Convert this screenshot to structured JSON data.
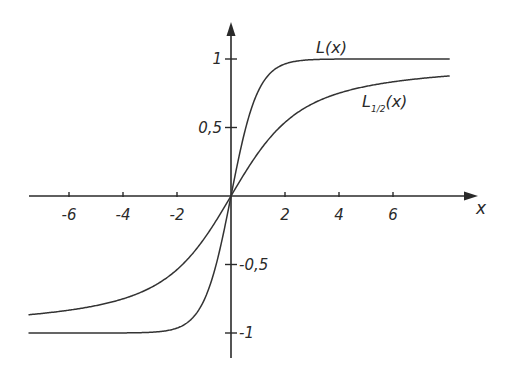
{
  "chart_data": {
    "type": "line",
    "title": "",
    "xlabel": "x",
    "ylabel": "",
    "xlim": [
      -7.5,
      8.1
    ],
    "ylim": [
      -1.2,
      1.3
    ],
    "grid": false,
    "legend_position": "inline labels",
    "x_ticks": [
      -6,
      -4,
      -2,
      2,
      4,
      6
    ],
    "x_tick_labels": [
      "-6",
      "-4",
      "-2",
      "2",
      "4",
      "6"
    ],
    "y_ticks": [
      1,
      0.5,
      -0.5,
      -1
    ],
    "y_tick_labels": [
      "1",
      "0,5",
      "-0,5",
      "-1"
    ],
    "series": [
      {
        "name": "L(x)",
        "label_main": "L",
        "label_sub": "",
        "label_arg": "(x)",
        "description": "steep sigmoid, saturates at ±1 near |x|≈2 (approx. tanh x)",
        "x": [
          -7.5,
          -6,
          -4,
          -3,
          -2,
          -1.5,
          -1,
          -0.5,
          0,
          0.5,
          1,
          1.5,
          2,
          3,
          4,
          6,
          8.1
        ],
        "y": [
          -1.0,
          -1.0,
          -1.0,
          -0.99,
          -0.96,
          -0.9,
          -0.76,
          -0.46,
          0.0,
          0.46,
          0.76,
          0.9,
          0.96,
          0.99,
          1.0,
          1.0,
          1.0
        ]
      },
      {
        "name": "L1/2(x)",
        "label_main": "L",
        "label_sub": "1/2",
        "label_arg": "(x)",
        "description": "slower sigmoid approaching ±1 (approx. Langevin function coth x − 1/x)",
        "x": [
          -7.5,
          -6,
          -4,
          -3,
          -2,
          -1,
          -0.5,
          0,
          0.5,
          1,
          2,
          3,
          4,
          6,
          8.1
        ],
        "y": [
          -0.87,
          -0.83,
          -0.75,
          -0.67,
          -0.54,
          -0.31,
          -0.16,
          0.0,
          0.16,
          0.31,
          0.54,
          0.67,
          0.75,
          0.83,
          0.88
        ]
      }
    ]
  }
}
